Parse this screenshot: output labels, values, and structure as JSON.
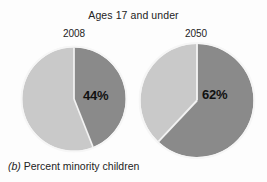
{
  "figure": {
    "title": "Ages 17 and under",
    "caption_letter": "(b)",
    "caption_text": "Percent minority children"
  },
  "colors": {
    "minority_slice": "#8a8a8a",
    "other_slice": "#c9c9c9",
    "slice_divider": "#f2f2f2",
    "background": "#fdfdfd",
    "text": "#232323"
  },
  "pies": [
    {
      "name": "pie-2008",
      "year_label": "2008",
      "value_label": "44%",
      "minority_percent": 44,
      "other_percent": 56
    },
    {
      "name": "pie-2050",
      "year_label": "2050",
      "value_label": "62%",
      "minority_percent": 62,
      "other_percent": 38
    }
  ],
  "chart_data": {
    "type": "pie",
    "title": "Ages 17 and under",
    "subtitle": "(b) Percent minority children",
    "xlabel": "",
    "ylabel": "",
    "grid": false,
    "legend_position": "none",
    "charts": [
      {
        "name": "2008",
        "labels": [
          "Minority children",
          "Non-minority children"
        ],
        "values": [
          44,
          56
        ],
        "data_labels": [
          "44%",
          ""
        ],
        "colors": [
          "#8a8a8a",
          "#c9c9c9"
        ],
        "start_angle_deg": 0,
        "direction": "clockwise"
      },
      {
        "name": "2050",
        "labels": [
          "Minority children",
          "Non-minority children"
        ],
        "values": [
          62,
          38
        ],
        "data_labels": [
          "62%",
          ""
        ],
        "colors": [
          "#8a8a8a",
          "#c9c9c9"
        ],
        "start_angle_deg": 0,
        "direction": "clockwise"
      }
    ]
  }
}
